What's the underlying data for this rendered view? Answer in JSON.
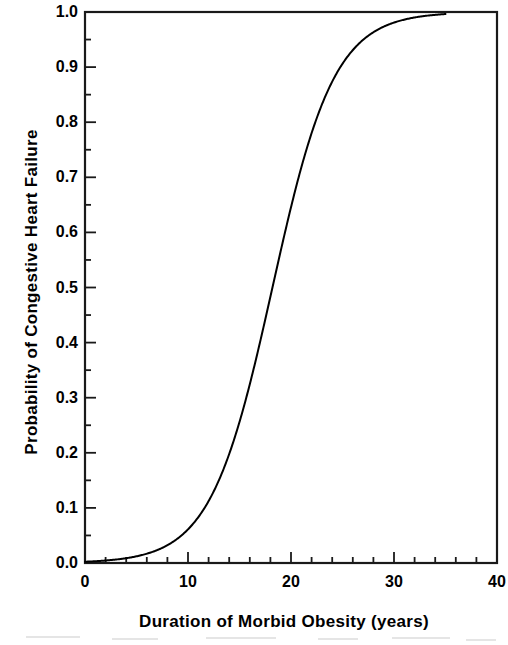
{
  "chart_data": {
    "type": "line",
    "title": "",
    "xlabel": "Duration of Morbid Obesity (years)",
    "ylabel": "Probability of Congestive Heart Failure",
    "xlim": [
      0,
      40
    ],
    "ylim": [
      0.0,
      1.0
    ],
    "xticks": [
      "0",
      "10",
      "20",
      "30",
      "40"
    ],
    "xtick_values": [
      0,
      10,
      20,
      30,
      40
    ],
    "x_minor_tick_interval": 2,
    "yticks": [
      "0.0",
      "0.1",
      "0.2",
      "0.3",
      "0.4",
      "0.5",
      "0.6",
      "0.7",
      "0.8",
      "0.9",
      "1.0"
    ],
    "ytick_values": [
      0.0,
      0.1,
      0.2,
      0.3,
      0.4,
      0.5,
      0.6,
      0.7,
      0.8,
      0.9,
      1.0
    ],
    "y_minor_tick_interval": 0.05,
    "grid": false,
    "legend": null,
    "legend_position": "none",
    "line_color": "#000000",
    "line_width": 2,
    "frame": true,
    "tick_direction": "in",
    "series": [
      {
        "name": "Probability of Congestive Heart Failure",
        "model": "logistic",
        "midpoint_x": 18.2,
        "scale": 3.0,
        "x": [
          0,
          1,
          2,
          3,
          4,
          5,
          6,
          7,
          8,
          9,
          10,
          11,
          12,
          13,
          14,
          15,
          16,
          17,
          18,
          19,
          20,
          21,
          22,
          23,
          24,
          25,
          26,
          27,
          28,
          29,
          30,
          31,
          32,
          33,
          34,
          35
        ],
        "values": [
          0.002,
          0.003,
          0.004,
          0.005,
          0.007,
          0.01,
          0.014,
          0.019,
          0.027,
          0.037,
          0.051,
          0.07,
          0.095,
          0.128,
          0.17,
          0.223,
          0.287,
          0.359,
          0.437,
          0.517,
          0.596,
          0.668,
          0.733,
          0.788,
          0.834,
          0.872,
          0.902,
          0.926,
          0.944,
          0.958,
          0.969,
          0.977,
          0.983,
          0.987,
          0.991,
          0.993
        ]
      }
    ]
  },
  "axes": {
    "x_label": "Duration of Morbid Obesity (years)",
    "y_label": "Probability of Congestive Heart Failure"
  }
}
